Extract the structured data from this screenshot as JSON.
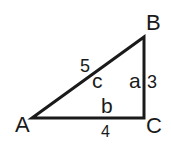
{
  "diagram": {
    "type": "right-triangle",
    "vertices": [
      {
        "name": "A",
        "label": "A"
      },
      {
        "name": "B",
        "label": "B"
      },
      {
        "name": "C",
        "label": "C"
      }
    ],
    "sides": {
      "a": {
        "label": "a",
        "length": "3"
      },
      "b": {
        "label": "b",
        "length": "4"
      },
      "c": {
        "label": "c",
        "length": "5"
      }
    },
    "stroke_color": "#1a1a1a"
  }
}
